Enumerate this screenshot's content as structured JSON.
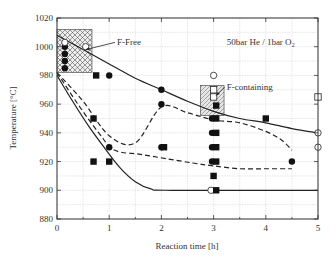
{
  "chart_data": {
    "type": "scatter",
    "title": "",
    "xlabel": "Reaction time [h]",
    "ylabel": "Temperature [°C]",
    "xlim": [
      0,
      5
    ],
    "ylim": [
      880,
      1020
    ],
    "xticks": [
      0,
      1,
      2,
      3,
      4,
      5
    ],
    "yticks": [
      880,
      900,
      920,
      940,
      960,
      980,
      1000,
      1020
    ],
    "grid": true,
    "annotations": [
      {
        "text": "50bar He / 1bar O",
        "subscript": "2",
        "x": 3.25,
        "y": 1003
      },
      {
        "text": "F-Free",
        "x": 1.15,
        "y": 1003,
        "arrow_to": [
          0.55,
          998
        ]
      },
      {
        "text": "F-containing",
        "x": 3.25,
        "y": 972,
        "arrow_to": [
          3.05,
          966
        ]
      }
    ],
    "regions": [
      {
        "name": "F-Free region",
        "pattern": "crosshatch",
        "x": [
          0,
          0.67
        ],
        "y": [
          982,
          1012
        ]
      },
      {
        "name": "F-containing region",
        "pattern": "diagonal",
        "x": [
          2.75,
          3.2
        ],
        "y": [
          952,
          973
        ]
      }
    ],
    "series": [
      {
        "name": "Filled circles",
        "marker": "circle-filled",
        "points": [
          [
            0.15,
            1000
          ],
          [
            0.15,
            995
          ],
          [
            0.15,
            990
          ],
          [
            0.15,
            985
          ],
          [
            1.0,
            980
          ],
          [
            1.0,
            930
          ],
          [
            2.0,
            970
          ],
          [
            2.0,
            960
          ],
          [
            2.0,
            930
          ],
          [
            2.97,
            950
          ],
          [
            2.97,
            940
          ],
          [
            2.97,
            930
          ],
          [
            2.97,
            920
          ],
          [
            4.5,
            920
          ]
        ]
      },
      {
        "name": "Open circles",
        "marker": "circle-open",
        "points": [
          [
            0.15,
            1003
          ],
          [
            0.55,
            1000
          ],
          [
            3.0,
            980
          ],
          [
            2.95,
            900
          ],
          [
            5.0,
            940
          ],
          [
            5.0,
            930
          ]
        ]
      },
      {
        "name": "Filled squares",
        "marker": "square-filled",
        "points": [
          [
            0.75,
            980
          ],
          [
            0.7,
            950
          ],
          [
            0.7,
            920
          ],
          [
            1.0,
            920
          ],
          [
            2.05,
            930
          ],
          [
            3.05,
            959
          ],
          [
            3.05,
            950
          ],
          [
            3.05,
            940
          ],
          [
            3.05,
            930
          ],
          [
            3.05,
            920
          ],
          [
            3.0,
            910
          ],
          [
            3.05,
            900
          ],
          [
            4.0,
            950
          ]
        ]
      },
      {
        "name": "Open squares",
        "marker": "square-open",
        "points": [
          [
            3.0,
            970
          ],
          [
            3.0,
            965
          ],
          [
            5.0,
            965
          ]
        ]
      }
    ],
    "curves": [
      {
        "name": "Upper solid boundary",
        "style": "solid",
        "points": [
          [
            0,
            1008
          ],
          [
            0.5,
            998
          ],
          [
            1,
            988
          ],
          [
            1.5,
            978
          ],
          [
            2,
            970
          ],
          [
            2.5,
            962
          ],
          [
            3,
            955
          ],
          [
            3.5,
            950
          ],
          [
            4,
            947
          ],
          [
            4.5,
            943
          ],
          [
            5,
            940
          ]
        ]
      },
      {
        "name": "Lower solid boundary",
        "style": "solid",
        "points": [
          [
            0,
            980
          ],
          [
            0.3,
            962
          ],
          [
            0.6,
            945
          ],
          [
            0.9,
            930
          ],
          [
            1.2,
            916
          ],
          [
            1.5,
            906
          ],
          [
            1.8,
            901
          ],
          [
            2.2,
            900
          ],
          [
            5,
            900
          ]
        ]
      },
      {
        "name": "Upper dashed",
        "style": "dashed",
        "points": [
          [
            0,
            982
          ],
          [
            0.5,
            962
          ],
          [
            1,
            938
          ],
          [
            1.5,
            933
          ],
          [
            2,
            958
          ],
          [
            2.5,
            954
          ],
          [
            3,
            949
          ],
          [
            3.5,
            947
          ],
          [
            4,
            941
          ],
          [
            4.3,
            935
          ],
          [
            4.5,
            928
          ]
        ]
      },
      {
        "name": "Lower dashed",
        "style": "dashed",
        "points": [
          [
            0,
            982
          ],
          [
            0.4,
            960
          ],
          [
            0.8,
            940
          ],
          [
            1.1,
            928
          ],
          [
            1.6,
            925
          ],
          [
            2.1,
            922
          ],
          [
            2.6,
            919
          ],
          [
            3.0,
            917
          ],
          [
            3.5,
            915
          ],
          [
            4.0,
            915
          ],
          [
            4.5,
            915
          ]
        ]
      }
    ]
  }
}
